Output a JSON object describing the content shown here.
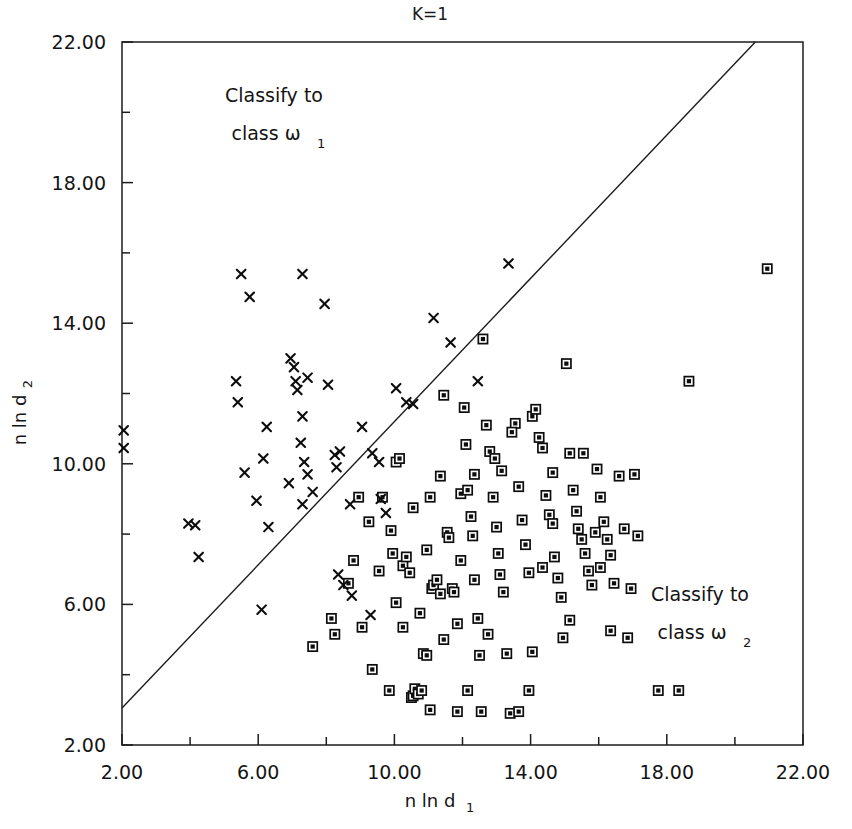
{
  "chart_data": {
    "type": "scatter",
    "title": "K=1",
    "xlabel": "n ln d_1",
    "xlabel_main": "n ln d",
    "xlabel_sub": "1",
    "ylabel_main": "n ln d",
    "ylabel_sub": "2",
    "xlim": [
      2.0,
      22.0
    ],
    "ylim": [
      2.0,
      22.0
    ],
    "grid": false,
    "legend": "none",
    "xticks": [
      2.0,
      6.0,
      10.0,
      14.0,
      18.0,
      22.0
    ],
    "xtick_labels": [
      "2.00",
      "6.00",
      "10.00",
      "14.00",
      "18.00",
      "22.00"
    ],
    "yticks": [
      2.0,
      6.0,
      10.0,
      14.0,
      18.0,
      22.0
    ],
    "ytick_labels": [
      "2.00",
      "6.00",
      "10.00",
      "14.00",
      "18.00",
      "22.00"
    ],
    "minor_tick_step": 2.0,
    "annotations": [
      {
        "id": "region-1",
        "line1": "Classify to",
        "line2_main": "class ω",
        "line2_sub": "1",
        "x": 6.6,
        "y": 20.0
      },
      {
        "id": "region-2",
        "line1": "Classify to",
        "line2_main": "class ω",
        "line2_sub": "2",
        "x": 17.4,
        "y": 6.2
      }
    ],
    "decision_boundary": {
      "label": "decision-boundary",
      "type": "line",
      "x0": 2.0,
      "y0": 3.05,
      "x1": 20.6,
      "y1": 22.0,
      "slope": 1.02,
      "intercept": 1.01
    },
    "series": [
      {
        "name": "class-omega-1",
        "marker": "x",
        "color": "#0d0d0d",
        "points": [
          [
            2.05,
            10.95
          ],
          [
            2.05,
            10.45
          ],
          [
            4.15,
            8.25
          ],
          [
            4.25,
            7.35
          ],
          [
            5.35,
            12.35
          ],
          [
            5.4,
            11.75
          ],
          [
            5.5,
            15.4
          ],
          [
            5.75,
            14.75
          ],
          [
            5.6,
            9.75
          ],
          [
            5.95,
            8.95
          ],
          [
            6.15,
            10.15
          ],
          [
            6.25,
            11.05
          ],
          [
            6.3,
            8.2
          ],
          [
            6.9,
            9.45
          ],
          [
            6.95,
            13.0
          ],
          [
            7.05,
            12.75
          ],
          [
            7.1,
            12.35
          ],
          [
            7.15,
            12.1
          ],
          [
            7.3,
            15.4
          ],
          [
            7.45,
            12.45
          ],
          [
            7.3,
            11.35
          ],
          [
            7.25,
            10.6
          ],
          [
            7.35,
            10.05
          ],
          [
            7.45,
            9.7
          ],
          [
            7.6,
            9.2
          ],
          [
            7.3,
            8.85
          ],
          [
            7.95,
            14.55
          ],
          [
            8.05,
            12.25
          ],
          [
            8.25,
            10.25
          ],
          [
            8.3,
            9.9
          ],
          [
            8.4,
            10.35
          ],
          [
            8.35,
            6.85
          ],
          [
            8.5,
            6.55
          ],
          [
            8.7,
            8.85
          ],
          [
            9.05,
            11.05
          ],
          [
            9.3,
            5.7
          ],
          [
            9.35,
            10.3
          ],
          [
            9.55,
            10.05
          ],
          [
            9.75,
            8.6
          ],
          [
            10.05,
            12.15
          ],
          [
            10.35,
            11.75
          ],
          [
            10.55,
            11.7
          ],
          [
            11.15,
            14.15
          ],
          [
            11.65,
            13.45
          ],
          [
            12.45,
            12.35
          ],
          [
            13.35,
            15.7
          ],
          [
            3.95,
            8.3
          ],
          [
            6.1,
            5.85
          ],
          [
            8.75,
            6.25
          ],
          [
            9.6,
            9.0
          ]
        ]
      },
      {
        "name": "class-omega-2",
        "marker": "square",
        "color": "#0d0d0d",
        "points": [
          [
            8.15,
            5.6
          ],
          [
            8.25,
            5.15
          ],
          [
            8.8,
            7.25
          ],
          [
            9.05,
            5.35
          ],
          [
            9.35,
            4.15
          ],
          [
            9.65,
            9.05
          ],
          [
            9.85,
            3.55
          ],
          [
            9.9,
            8.1
          ],
          [
            10.05,
            10.05
          ],
          [
            10.15,
            10.15
          ],
          [
            10.25,
            7.1
          ],
          [
            10.35,
            7.35
          ],
          [
            10.45,
            6.9
          ],
          [
            10.5,
            3.35
          ],
          [
            10.55,
            3.4
          ],
          [
            10.6,
            3.6
          ],
          [
            10.7,
            3.45
          ],
          [
            10.8,
            3.55
          ],
          [
            10.85,
            4.6
          ],
          [
            10.95,
            4.55
          ],
          [
            11.05,
            9.05
          ],
          [
            11.1,
            6.45
          ],
          [
            11.15,
            6.55
          ],
          [
            11.25,
            6.7
          ],
          [
            11.35,
            6.3
          ],
          [
            11.45,
            5.0
          ],
          [
            11.55,
            8.05
          ],
          [
            11.6,
            7.9
          ],
          [
            11.7,
            6.45
          ],
          [
            11.75,
            6.35
          ],
          [
            11.85,
            2.95
          ],
          [
            11.95,
            9.15
          ],
          [
            12.05,
            11.6
          ],
          [
            12.1,
            10.55
          ],
          [
            12.15,
            9.25
          ],
          [
            12.25,
            8.5
          ],
          [
            12.3,
            7.95
          ],
          [
            12.35,
            6.7
          ],
          [
            12.45,
            5.6
          ],
          [
            12.5,
            4.55
          ],
          [
            12.6,
            13.55
          ],
          [
            12.7,
            11.1
          ],
          [
            12.8,
            10.35
          ],
          [
            12.9,
            9.05
          ],
          [
            13.0,
            8.2
          ],
          [
            13.05,
            7.45
          ],
          [
            13.1,
            6.85
          ],
          [
            13.2,
            6.35
          ],
          [
            13.3,
            4.6
          ],
          [
            13.4,
            2.9
          ],
          [
            13.55,
            11.15
          ],
          [
            13.65,
            9.35
          ],
          [
            13.75,
            8.4
          ],
          [
            13.85,
            7.7
          ],
          [
            13.95,
            6.9
          ],
          [
            14.05,
            11.35
          ],
          [
            14.15,
            11.55
          ],
          [
            14.25,
            10.75
          ],
          [
            14.35,
            10.45
          ],
          [
            14.45,
            9.1
          ],
          [
            14.55,
            8.55
          ],
          [
            14.65,
            8.3
          ],
          [
            14.7,
            7.35
          ],
          [
            14.8,
            6.75
          ],
          [
            14.9,
            6.2
          ],
          [
            14.95,
            5.05
          ],
          [
            15.05,
            12.85
          ],
          [
            15.15,
            10.3
          ],
          [
            15.25,
            9.25
          ],
          [
            15.35,
            8.65
          ],
          [
            15.4,
            8.15
          ],
          [
            15.5,
            7.85
          ],
          [
            15.6,
            7.45
          ],
          [
            15.7,
            6.95
          ],
          [
            15.8,
            6.55
          ],
          [
            15.9,
            8.05
          ],
          [
            16.05,
            9.05
          ],
          [
            16.15,
            8.35
          ],
          [
            16.25,
            7.85
          ],
          [
            16.35,
            7.4
          ],
          [
            16.45,
            6.6
          ],
          [
            16.6,
            9.65
          ],
          [
            16.75,
            8.15
          ],
          [
            16.85,
            5.05
          ],
          [
            17.05,
            9.7
          ],
          [
            17.15,
            7.95
          ],
          [
            11.45,
            11.95
          ],
          [
            10.55,
            8.75
          ],
          [
            12.55,
            2.95
          ],
          [
            13.65,
            2.95
          ],
          [
            17.75,
            3.55
          ],
          [
            18.35,
            3.55
          ],
          [
            18.65,
            12.35
          ],
          [
            20.95,
            15.55
          ],
          [
            7.6,
            4.8
          ],
          [
            8.65,
            6.6
          ],
          [
            9.55,
            6.95
          ],
          [
            10.25,
            5.35
          ],
          [
            10.95,
            7.55
          ],
          [
            11.35,
            9.65
          ],
          [
            11.85,
            5.45
          ],
          [
            12.15,
            3.55
          ],
          [
            12.95,
            10.15
          ],
          [
            14.05,
            4.65
          ],
          [
            15.15,
            5.55
          ],
          [
            16.35,
            5.25
          ],
          [
            9.25,
            8.35
          ],
          [
            10.05,
            6.05
          ],
          [
            11.05,
            3.0
          ],
          [
            12.35,
            9.7
          ],
          [
            13.45,
            10.9
          ],
          [
            14.65,
            9.75
          ],
          [
            15.95,
            9.85
          ],
          [
            16.95,
            6.45
          ],
          [
            10.75,
            5.75
          ],
          [
            11.95,
            7.25
          ],
          [
            13.15,
            9.8
          ],
          [
            14.35,
            7.05
          ],
          [
            15.55,
            10.3
          ],
          [
            8.95,
            9.05
          ],
          [
            9.95,
            7.45
          ],
          [
            12.75,
            5.15
          ],
          [
            13.95,
            3.55
          ],
          [
            16.05,
            7.05
          ]
        ]
      }
    ]
  }
}
